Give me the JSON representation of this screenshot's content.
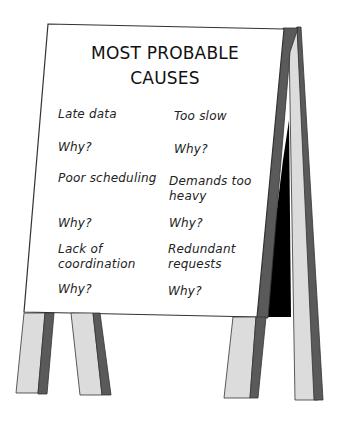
{
  "sign": {
    "title_line1": "MOST PROBABLE",
    "title_line2": "CAUSES",
    "left_column": [
      {
        "cause": "Late data",
        "prompt": "Why?"
      },
      {
        "cause": "Poor scheduling",
        "prompt": "Why?"
      },
      {
        "cause": "Lack of coordination",
        "cause_line1": "Lack of",
        "cause_line2": "coordination",
        "prompt": "Why?"
      }
    ],
    "right_column": [
      {
        "cause": "Too slow",
        "prompt": "Why?"
      },
      {
        "cause": "Demands too heavy",
        "cause_line1": "Demands too",
        "cause_line2": "heavy",
        "prompt": "Why?"
      },
      {
        "cause": "Redundant requests",
        "cause_line1": "Redundant",
        "cause_line2": "requests",
        "prompt": "Why?"
      }
    ]
  },
  "colors": {
    "board": "#ffffff",
    "outline": "#333333",
    "leg_light": "#dcdcdc",
    "leg_dark": "#5a5a5a",
    "interior": "#000000"
  }
}
